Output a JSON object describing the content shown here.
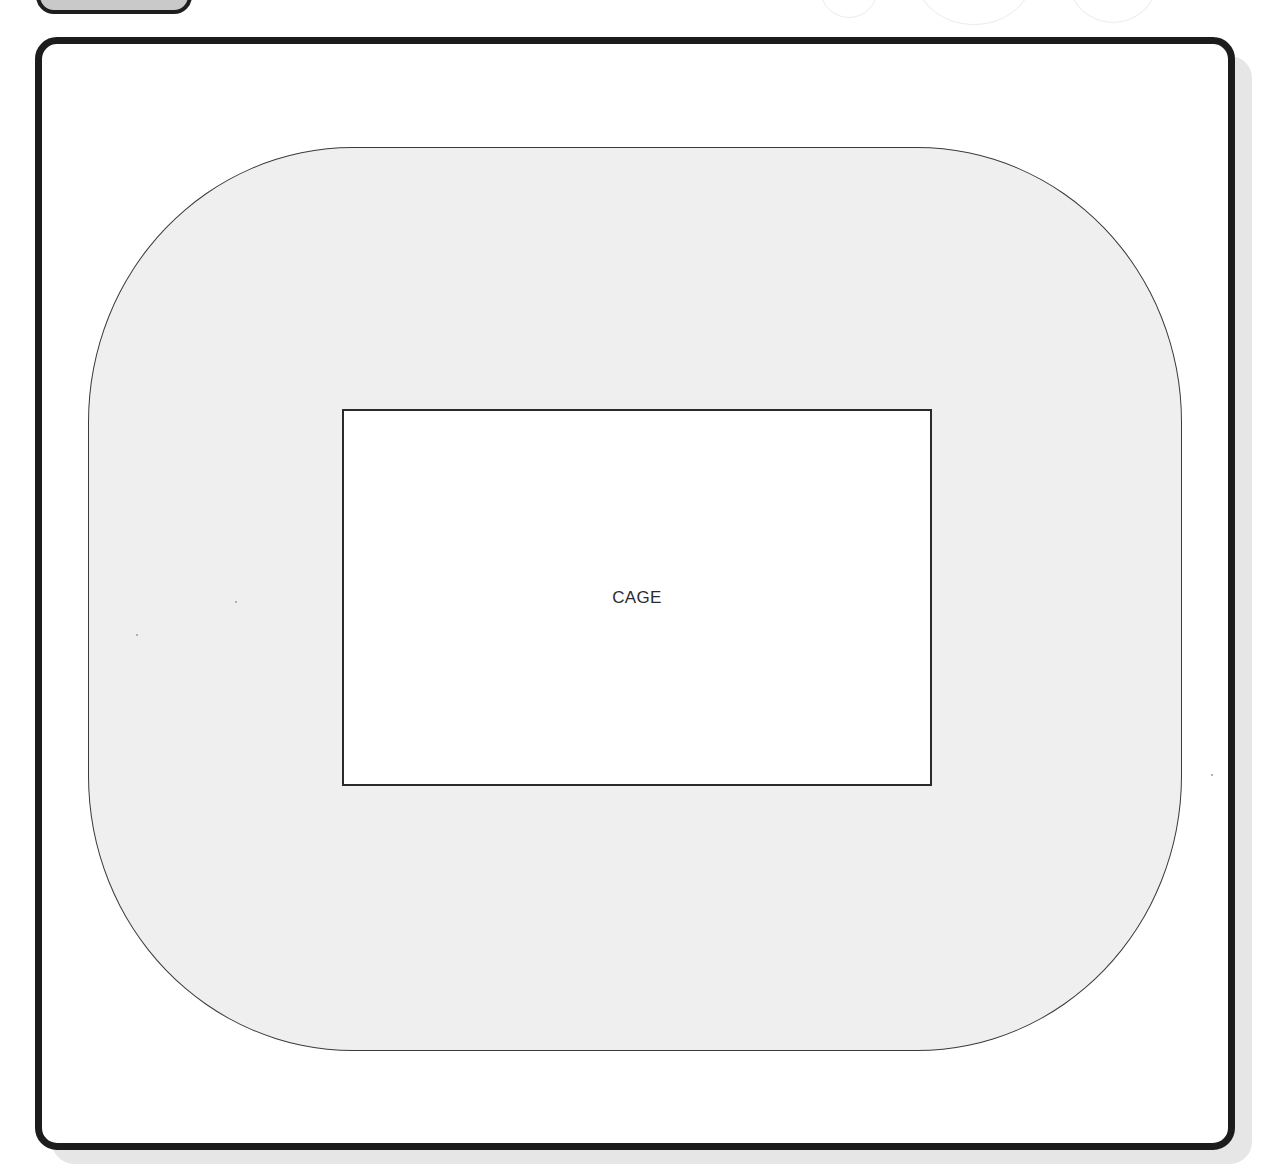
{
  "diagram": {
    "type": "enclosure-layout",
    "frame": {
      "border_color": "#1c1c1c",
      "background": "#ffffff"
    },
    "tab": {
      "fill": "#c9c9c9",
      "label": ""
    },
    "enclosure": {
      "shape": "rounded-rectangle",
      "fill": "#efefef",
      "label": ""
    },
    "cage": {
      "shape": "rectangle",
      "fill": "#ffffff",
      "label": "CAGE"
    }
  }
}
